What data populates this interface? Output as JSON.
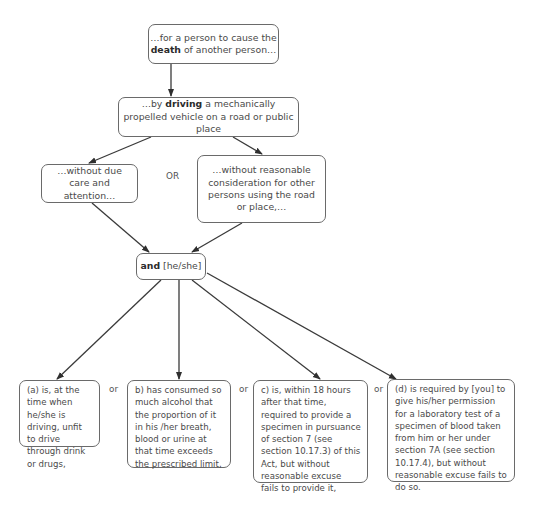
{
  "nodes": {
    "death": {
      "pre": "…for a person to cause the ",
      "bold": "death",
      "post": " of another person…"
    },
    "driving": {
      "pre": "…by ",
      "bold": "driving",
      "post": " a mechanically propelled vehicle on a road or public place"
    },
    "due_care": {
      "text": "…without due care and attention…"
    },
    "consideration": {
      "text": "…without reasonable consideration for other persons using the road or place,…"
    },
    "and": {
      "bold": "and",
      "post": " [he/she]"
    },
    "a": {
      "text": "(a) is, at the time when he/she is driving, unfit to drive through drink or drugs,"
    },
    "b": {
      "text": "b) has consumed so much alcohol that the proportion of it in his /her breath, blood or urine at that time exceeds the prescribed limit,"
    },
    "c": {
      "text": "c) is, within 18 hours after that time, required to provide a  specimen in pursuance of section 7 (see section 10.17.3) of this Act, but without reasonable excuse fails to provide it,"
    },
    "d": {
      "text": "(d) is required by [you] to give his/her permission for a laboratory test of a specimen of blood taken from him or her under section 7A (see section 10.17.4), but without reasonable excuse fails to do so."
    }
  },
  "connectors": {
    "or_upper": "OR",
    "or_ab": "or",
    "or_bc": "or",
    "or_cd": "or"
  },
  "colors": {
    "line": "#3a3a3a",
    "border": "#6a6a6a",
    "text": "#4a4a4a"
  }
}
